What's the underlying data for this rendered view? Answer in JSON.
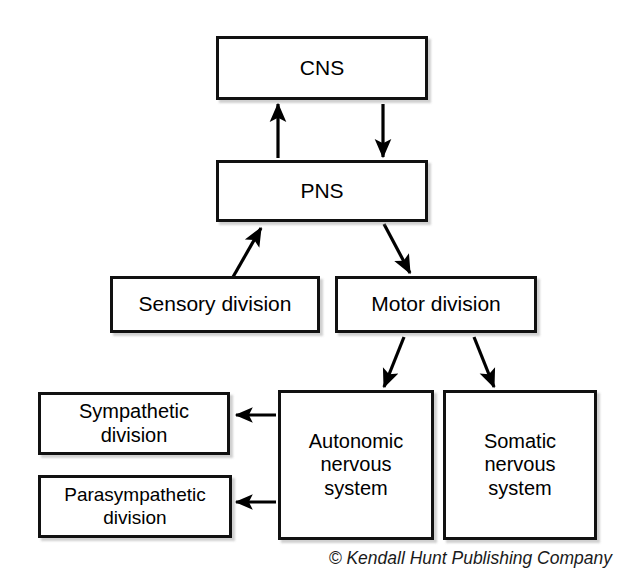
{
  "diagram": {
    "nodes": [
      {
        "id": "cns",
        "label": "CNS"
      },
      {
        "id": "pns",
        "label": "PNS"
      },
      {
        "id": "sensory",
        "label": "Sensory division"
      },
      {
        "id": "motor",
        "label": "Motor division"
      },
      {
        "id": "sympathetic",
        "label": "Sympathetic\ndivision"
      },
      {
        "id": "parasympathetic",
        "label": "Parasympathetic\ndivision"
      },
      {
        "id": "autonomic",
        "label": "Autonomic\nnervous\nsystem"
      },
      {
        "id": "somatic",
        "label": "Somatic\nnervous\nsystem"
      }
    ],
    "edges": [
      {
        "id": "pns-to-cns",
        "from": "pns",
        "to": "cns",
        "direction": "up"
      },
      {
        "id": "cns-to-pns",
        "from": "cns",
        "to": "pns",
        "direction": "down"
      },
      {
        "id": "sensory-to-pns",
        "from": "sensory",
        "to": "pns",
        "direction": "up-right"
      },
      {
        "id": "pns-to-motor",
        "from": "pns",
        "to": "motor",
        "direction": "down-right"
      },
      {
        "id": "motor-to-autonomic",
        "from": "motor",
        "to": "autonomic",
        "direction": "down-left"
      },
      {
        "id": "motor-to-somatic",
        "from": "motor",
        "to": "somatic",
        "direction": "down-right"
      },
      {
        "id": "autonomic-to-sympathetic",
        "from": "autonomic",
        "to": "sympathetic",
        "direction": "left"
      },
      {
        "id": "autonomic-to-parasympathetic",
        "from": "autonomic",
        "to": "parasympathetic",
        "direction": "left"
      }
    ],
    "colors": {
      "background": "#ffffff",
      "box_border": "#111111",
      "box_fill": "#ffffff",
      "connector": "#000000",
      "text": "#000000"
    }
  },
  "credit": {
    "text": "© Kendall Hunt Publishing Company"
  }
}
